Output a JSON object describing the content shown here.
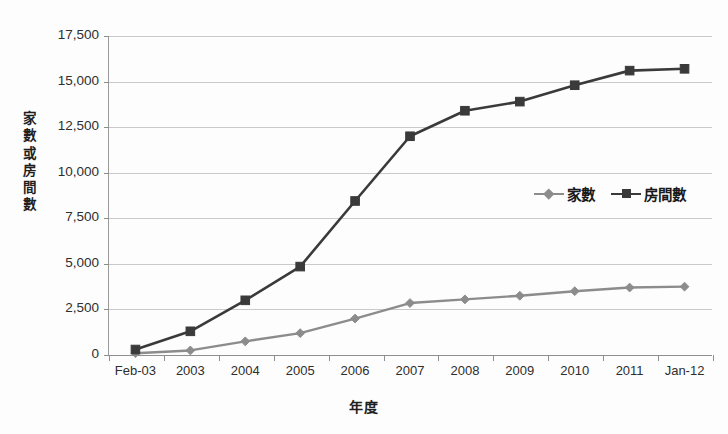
{
  "chart_data": {
    "type": "line",
    "title": "",
    "xlabel": "年度",
    "ylabel": "家數或房間數",
    "categories": [
      "Feb-03",
      "2003",
      "2004",
      "2005",
      "2006",
      "2007",
      "2008",
      "2009",
      "2010",
      "2011",
      "Jan-12"
    ],
    "ylim": [
      0,
      17500
    ],
    "yticks": [
      0,
      2500,
      5000,
      7500,
      10000,
      12500,
      15000,
      17500
    ],
    "ytick_labels": [
      "0",
      "2,500",
      "5,000",
      "7,500",
      "10,000",
      "12,500",
      "15,000",
      "17,500"
    ],
    "grid": true,
    "legend_position": "inside-right",
    "series": [
      {
        "name": "家數",
        "marker": "diamond",
        "color": "#8c8c8c",
        "values": [
          100,
          250,
          750,
          1200,
          2000,
          2850,
          3050,
          3250,
          3500,
          3700,
          3750
        ]
      },
      {
        "name": "房間數",
        "marker": "square",
        "color": "#3a3a3a",
        "values": [
          300,
          1300,
          3000,
          4850,
          8450,
          12000,
          13400,
          13900,
          14800,
          15600,
          15700
        ]
      }
    ]
  },
  "legend": {
    "entries": [
      {
        "label": "家數"
      },
      {
        "label": "房間數"
      }
    ]
  },
  "axes": {
    "y_title_chars": [
      "家",
      "數",
      "或",
      "房",
      "間",
      "數"
    ],
    "x_title": "年度"
  },
  "colors": {
    "series_houses": "#8c8c8c",
    "series_rooms": "#3a3a3a",
    "gridline": "#c9c9c9",
    "axis": "#8e8e8e",
    "text": "#2e2e2e",
    "background": "#fdfdfd"
  }
}
